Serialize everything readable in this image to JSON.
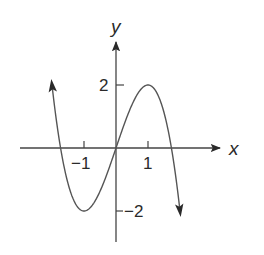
{
  "chart_data": {
    "type": "line",
    "title": "",
    "xlabel": "x",
    "ylabel": "y",
    "function": "y = -x^3 + 3x",
    "x_ticks": [
      -1,
      1
    ],
    "x_tick_labels": [
      "−1",
      "1"
    ],
    "y_ticks": [
      2,
      -2
    ],
    "y_tick_labels": [
      "2",
      "−2"
    ],
    "xlim": [
      -3,
      3.3
    ],
    "ylim": [
      -3,
      3.3
    ],
    "grid": false,
    "legend": null,
    "series": [
      {
        "name": "f(x)",
        "x": [
          -2.05,
          -1.5,
          -1,
          -0.5,
          0,
          0.5,
          1,
          1.5,
          2.05
        ],
        "y": [
          2.47,
          1.125,
          -2,
          -1.375,
          0,
          1.375,
          2,
          1.125,
          -2.47
        ],
        "arrows_at_ends": true
      }
    ],
    "key_points": [
      {
        "label": "local max",
        "x": 1,
        "y": 2
      },
      {
        "label": "local min",
        "x": -1,
        "y": -2
      },
      {
        "label": "origin",
        "x": 0,
        "y": 0
      }
    ],
    "colors": {
      "ink": "#2a2a2a",
      "curve": "#555555",
      "background": "#ffffff"
    }
  },
  "labels": {
    "x_axis": "x",
    "y_axis": "y",
    "tick_x_neg1": "−1",
    "tick_x_pos1": "1",
    "tick_y_pos2": "2",
    "tick_y_neg2": "−2"
  }
}
